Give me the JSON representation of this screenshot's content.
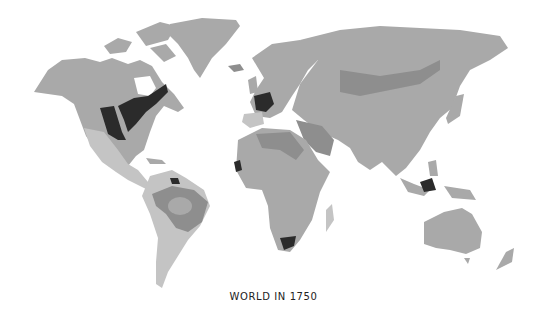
{
  "map": {
    "title": "WORLD IN 1750",
    "projection": "world",
    "palette": {
      "background": "#ffffff",
      "land_base": "#a9a9a9",
      "land_light": "#c4c4c4",
      "land_medium": "#8e8e8e",
      "land_dark": "#7a7a7a",
      "highlight_darkest": "#2b2b2b",
      "water": "#ffffff"
    },
    "regions": [
      {
        "name": "North America",
        "shade": "land_base"
      },
      {
        "name": "Greenland",
        "shade": "land_base"
      },
      {
        "name": "French North America",
        "shade": "highlight_darkest"
      },
      {
        "name": "Central America / Mexico",
        "shade": "land_light"
      },
      {
        "name": "South America",
        "shade": "land_light"
      },
      {
        "name": "Brazil interior",
        "shade": "land_medium"
      },
      {
        "name": "French Guiana",
        "shade": "highlight_darkest"
      },
      {
        "name": "Europe",
        "shade": "land_base"
      },
      {
        "name": "France",
        "shade": "highlight_darkest"
      },
      {
        "name": "Iberia",
        "shade": "land_light"
      },
      {
        "name": "Africa",
        "shade": "land_base"
      },
      {
        "name": "Senegal",
        "shade": "highlight_darkest"
      },
      {
        "name": "Cape Colony",
        "shade": "highlight_darkest"
      },
      {
        "name": "Madagascar",
        "shade": "land_light"
      },
      {
        "name": "Asia",
        "shade": "land_base"
      },
      {
        "name": "Siberian band",
        "shade": "land_medium"
      },
      {
        "name": "Middle East",
        "shade": "land_medium"
      },
      {
        "name": "Borneo / East Indies",
        "shade": "highlight_darkest"
      },
      {
        "name": "Australia",
        "shade": "land_base"
      },
      {
        "name": "New Zealand",
        "shade": "land_base"
      }
    ]
  }
}
